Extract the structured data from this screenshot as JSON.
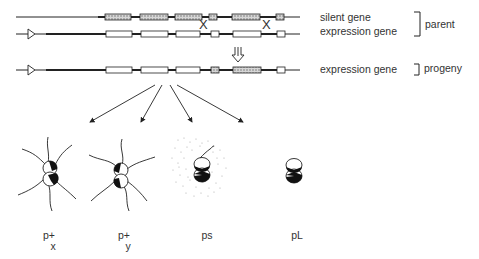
{
  "labels": {
    "silent_gene": "silent gene",
    "expression_gene_parent": "expression gene",
    "parent": "parent",
    "expression_gene_progeny": "expression gene",
    "progeny": "progeny"
  },
  "crossover_marks": [
    "X",
    "X"
  ],
  "phenotypes": [
    {
      "name": "p+",
      "sub": "x",
      "description": "piliated colony, pilus variant x"
    },
    {
      "name": "p+",
      "sub": "y",
      "description": "piliated colony, pilus variant y"
    },
    {
      "name": "ps",
      "sub": "",
      "description": "pilus secreted (soluble pilin)"
    },
    {
      "name": "pL",
      "sub": "",
      "description": "non-piliated"
    }
  ],
  "colors": {
    "line": "#222222",
    "hatch": "#bdbdbd",
    "stipple": "#aaaaaa"
  }
}
